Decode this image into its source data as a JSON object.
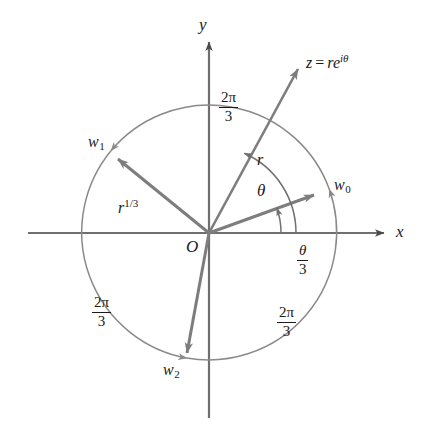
{
  "figure": {
    "axes": {
      "x_label": "x",
      "y_label": "y",
      "origin_label": "O"
    },
    "point_labels": {
      "z": {
        "var": "z",
        "equals": "=",
        "base": "re",
        "exponent": "iθ"
      },
      "w0": {
        "base": "w",
        "sub": "0"
      },
      "w1": {
        "base": "w",
        "sub": "1"
      },
      "w2": {
        "base": "w",
        "sub": "2"
      }
    },
    "magnitudes": {
      "z_radius": "r",
      "root_radius": {
        "base": "r",
        "exponent": "1/3"
      }
    },
    "angles": {
      "theta": "θ",
      "theta_over_three": {
        "num": "θ",
        "den": "3"
      },
      "two_pi_over_three": {
        "num": "2π",
        "den": "3"
      }
    },
    "arc_labels": [
      {
        "id": "arc-top",
        "num": "2π",
        "den": "3"
      },
      {
        "id": "arc-bottom-left",
        "num": "2π",
        "den": "3"
      },
      {
        "id": "arc-bottom-right",
        "num": "2π",
        "den": "3"
      }
    ],
    "colors": {
      "axis": "#6f6f6f",
      "vector": "#7d7d7d",
      "arc": "#8a8a8a",
      "text": "#1a1a1a",
      "background": "#ffffff"
    },
    "geometry": {
      "origin_x": 209,
      "origin_y": 233,
      "circle_radius": 128,
      "z_vector_angle_deg": 45,
      "w0_angle_deg": 20,
      "w1_angle_deg": 140,
      "w2_angle_deg": -100
    }
  }
}
